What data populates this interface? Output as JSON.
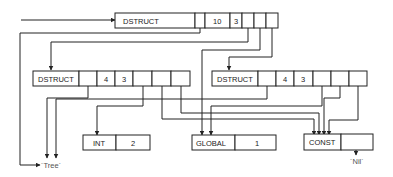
{
  "diagram": {
    "type": "linked data structure (pointer diagram)",
    "colors": {
      "line": "#222222",
      "background": "#ffffff"
    },
    "nodes": [
      {
        "id": "top_dstruct",
        "tag": "DSTRUCT",
        "fields": [
          "ptr",
          "10",
          "3",
          "ptr",
          "ptr",
          "ptr"
        ]
      },
      {
        "id": "left_dstruct",
        "tag": "DSTRUCT",
        "fields": [
          "ptr",
          "4",
          "3",
          "ptr",
          "ptr",
          "ptr"
        ]
      },
      {
        "id": "right_dstruct",
        "tag": "DSTRUCT",
        "fields": [
          "ptr",
          "4",
          "3",
          "ptr",
          "ptr",
          "ptr"
        ]
      },
      {
        "id": "int_node",
        "tag": "INT",
        "fields": [
          "2"
        ]
      },
      {
        "id": "global_node",
        "tag": "GLOBAL",
        "fields": [
          "1"
        ]
      },
      {
        "id": "const_node",
        "tag": "CONST",
        "fields": [
          "ptr"
        ]
      }
    ],
    "terminals": {
      "tree": "´Tree´",
      "nil": "´Nil´"
    },
    "labels": {
      "top_tag": "DSTRUCT",
      "top_v1": "10",
      "top_v2": "3",
      "left_tag": "DSTRUCT",
      "left_v1": "4",
      "left_v2": "3",
      "right_tag": "DSTRUCT",
      "right_v1": "4",
      "right_v2": "3",
      "int_tag": "INT",
      "int_v": "2",
      "global_tag": "GLOBAL",
      "global_v": "1",
      "const_tag": "CONST",
      "tree": "´Tree´",
      "nil": "´Nil´"
    },
    "edges": [
      {
        "from": "external",
        "to": "top_dstruct"
      },
      {
        "from": "top_dstruct.ptr0",
        "to": "tree"
      },
      {
        "from": "top_dstruct.ptr3",
        "to": "left_dstruct"
      },
      {
        "from": "top_dstruct.ptr4",
        "to": "global_node"
      },
      {
        "from": "top_dstruct.ptr5",
        "to": "right_dstruct"
      },
      {
        "from": "left_dstruct.ptr0",
        "to": "tree"
      },
      {
        "from": "left_dstruct.ptr3",
        "to": "int_node"
      },
      {
        "from": "left_dstruct.ptr4",
        "to": "const_node"
      },
      {
        "from": "left_dstruct.ptr5",
        "to": "const_node"
      },
      {
        "from": "right_dstruct.ptr0",
        "to": "tree"
      },
      {
        "from": "right_dstruct.ptr3",
        "to": "global_node"
      },
      {
        "from": "right_dstruct.ptr4",
        "to": "const_node"
      },
      {
        "from": "right_dstruct.ptr5",
        "to": "const_node"
      },
      {
        "from": "const_node.ptr0",
        "to": "nil"
      }
    ]
  }
}
